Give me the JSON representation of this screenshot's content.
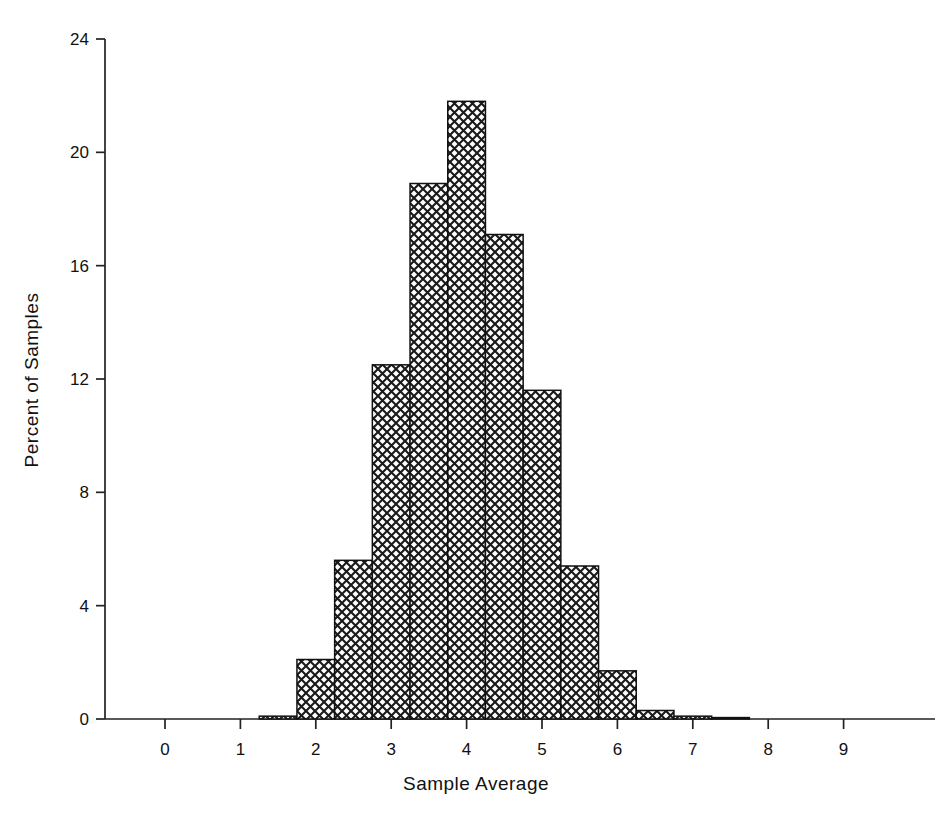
{
  "chart_data": {
    "type": "bar",
    "title": "",
    "xlabel": "Sample Average",
    "ylabel": "Percent of Samples",
    "xlim": [
      -0.45,
      9.7
    ],
    "ylim": [
      0,
      24
    ],
    "xticks": [
      0,
      1,
      2,
      3,
      4,
      5,
      6,
      7,
      8,
      9
    ],
    "yticks": [
      0,
      4,
      8,
      12,
      16,
      20,
      24
    ],
    "xtick_labels": [
      "0",
      "1",
      "2",
      "3",
      "4",
      "5",
      "6",
      "7",
      "8",
      "9"
    ],
    "ytick_labels": [
      "0",
      "4",
      "8",
      "12",
      "16",
      "20",
      "24"
    ],
    "grid": false,
    "legend": false,
    "bin_width": 0.5,
    "bin_edges": [
      1.25,
      1.75,
      2.25,
      2.75,
      3.25,
      3.75,
      4.25,
      4.75,
      5.25,
      5.75,
      6.25,
      6.75,
      7.25,
      7.75
    ],
    "categories": [
      "1.25-1.75",
      "1.75-2.25",
      "2.25-2.75",
      "2.75-3.25",
      "3.25-3.75",
      "3.75-4.25",
      "4.25-4.75",
      "4.75-5.25",
      "5.25-5.75",
      "5.75-6.25",
      "6.25-6.75",
      "6.75-7.25",
      "7.25-7.75"
    ],
    "values": [
      0.1,
      2.1,
      5.6,
      12.5,
      18.9,
      21.8,
      17.1,
      11.6,
      5.4,
      1.7,
      0.3,
      0.1,
      0.05
    ],
    "bar_style": {
      "fill_pattern": "cross-hatch",
      "pattern_color": "#1a1a1a",
      "background_color": "#ffffff",
      "edge_color": "#111111"
    }
  },
  "axes": {
    "y_axis_title": "Percent of Samples",
    "x_axis_title": "Sample Average"
  }
}
